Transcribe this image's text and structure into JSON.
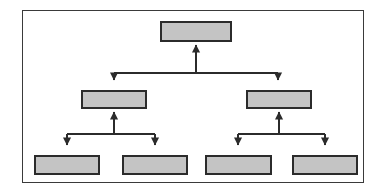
{
  "diagram": {
    "title": "",
    "type": "hierarchy-tree",
    "background_color": "#ffffff",
    "frame": {
      "border_color": "#3a3a3a",
      "fill_color": "#ffffff",
      "x": 22,
      "y": 10,
      "width": 342,
      "height": 173
    },
    "node_style": {
      "fill_color": "#c4c4c4",
      "border_color": "#2b2b2b",
      "border_width": 2
    },
    "connector_style": {
      "line_color": "#2b2b2b",
      "arrow_color": "#2b2b2b",
      "line_width": 1,
      "arrow_direction_to_parent": "up",
      "arrow_direction_to_child": "down"
    },
    "levels": [
      {
        "level": 1,
        "nodes": [
          {
            "id": "root",
            "label": "",
            "x": 160,
            "y": 21,
            "width": 72,
            "height": 21
          }
        ]
      },
      {
        "level": 2,
        "nodes": [
          {
            "id": "mid-left",
            "label": "",
            "x": 81,
            "y": 90,
            "width": 66,
            "height": 19
          },
          {
            "id": "mid-right",
            "label": "",
            "x": 246,
            "y": 90,
            "width": 66,
            "height": 19
          }
        ]
      },
      {
        "level": 3,
        "nodes": [
          {
            "id": "leaf-1",
            "label": "",
            "x": 34,
            "y": 155,
            "width": 66,
            "height": 20
          },
          {
            "id": "leaf-2",
            "label": "",
            "x": 122,
            "y": 155,
            "width": 66,
            "height": 20
          },
          {
            "id": "leaf-3",
            "label": "",
            "x": 205,
            "y": 155,
            "width": 67,
            "height": 20
          },
          {
            "id": "leaf-4",
            "label": "",
            "x": 292,
            "y": 155,
            "width": 66,
            "height": 20
          }
        ]
      }
    ],
    "edges": [
      {
        "from": "root",
        "to": "mid-left"
      },
      {
        "from": "root",
        "to": "mid-right"
      },
      {
        "from": "mid-left",
        "to": "leaf-1"
      },
      {
        "from": "mid-left",
        "to": "leaf-2"
      },
      {
        "from": "mid-right",
        "to": "leaf-3"
      },
      {
        "from": "mid-right",
        "to": "leaf-4"
      }
    ]
  }
}
